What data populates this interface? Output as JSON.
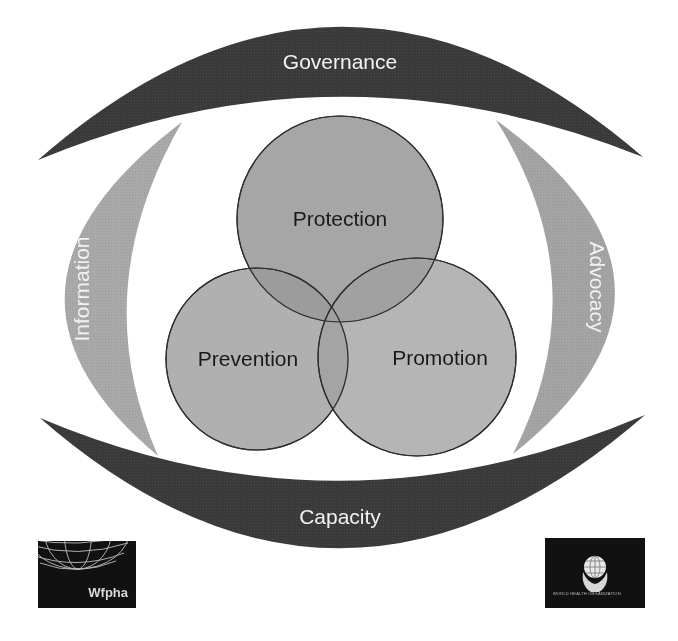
{
  "diagram": {
    "top_band": {
      "label": "Governance",
      "color": "#3a3a3a"
    },
    "bottom_band": {
      "label": "Capacity",
      "color": "#3a3a3a"
    },
    "left_crescent": {
      "label": "Information",
      "color": "#a8a8a8"
    },
    "right_crescent": {
      "label": "Advocacy",
      "color": "#a3a3a3"
    },
    "circles": [
      {
        "label": "Protection",
        "color": "#9e9e9e"
      },
      {
        "label": "Prevention",
        "color": "#9a9a9a"
      },
      {
        "label": "Promotion",
        "color": "#a0a0a0"
      }
    ]
  },
  "logos": {
    "left": {
      "text": "Wfpha",
      "icon": "globe-grid-icon"
    },
    "right": {
      "text": "WORLD HEALTH ORGANIZATION",
      "icon": "globe-in-hands-icon"
    }
  }
}
